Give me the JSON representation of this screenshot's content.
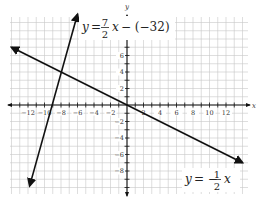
{
  "chart_data": {
    "type": "line",
    "title": "",
    "xlabel": "x",
    "ylabel": "y",
    "xlim": [
      -14,
      14.5
    ],
    "ylim": [
      -10.7,
      10.7
    ],
    "grid": true,
    "x_ticks": [
      -12,
      -10,
      -8,
      -6,
      -4,
      -2,
      2,
      4,
      6,
      8,
      10,
      12
    ],
    "y_ticks": [
      -8,
      -6,
      -4,
      -2,
      2,
      4,
      6
    ],
    "series": [
      {
        "name": "y = 7/2 x − (−32)",
        "label_text": {
          "lhs": "y",
          "eq": "=",
          "num": "7",
          "den": "2",
          "rest": "x − (−32)"
        },
        "slope": 3.5,
        "intercept": 32,
        "endpoints": [
          [
            -11.8,
            -9.8
          ],
          [
            -6,
            11
          ]
        ]
      },
      {
        "name": "y = −1/2 x",
        "label_text": {
          "lhs": "y",
          "eq": "= −",
          "num": "1",
          "den": "2",
          "rest": "x"
        },
        "slope": -0.5,
        "intercept": 0,
        "endpoints": [
          [
            -14,
            7
          ],
          [
            14,
            -7
          ]
        ]
      }
    ],
    "intersection": [
      -8,
      4
    ]
  }
}
